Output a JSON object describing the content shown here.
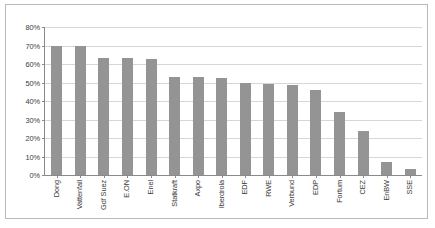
{
  "chart_data": {
    "type": "bar",
    "title": "",
    "xlabel": "",
    "ylabel": "",
    "ylim": [
      0,
      80
    ],
    "ytick_labels": [
      "80%",
      "70%",
      "60%",
      "50%",
      "40%",
      "30%",
      "20%",
      "10%",
      "0%"
    ],
    "ytick_values": [
      80,
      70,
      60,
      50,
      40,
      30,
      20,
      10,
      0
    ],
    "grid": true,
    "legend": "none",
    "bar_color": "#949494",
    "gridline_color": "#d6d6d6",
    "axis_color": "#8a8a8a",
    "categories": [
      "Dong",
      "Vattenfall",
      "Gdf Suez",
      "E.ON",
      "Enel",
      "Statkraft",
      "Axpo",
      "Iberdrola",
      "EDF",
      "RWE",
      "Verbund",
      "EDP",
      "Fortum",
      "CEZ",
      "EnBW",
      "SSE"
    ],
    "values": [
      70,
      70,
      63,
      63,
      62.5,
      53,
      53,
      52.5,
      50,
      49,
      48.5,
      46,
      34,
      24,
      7,
      3
    ]
  }
}
